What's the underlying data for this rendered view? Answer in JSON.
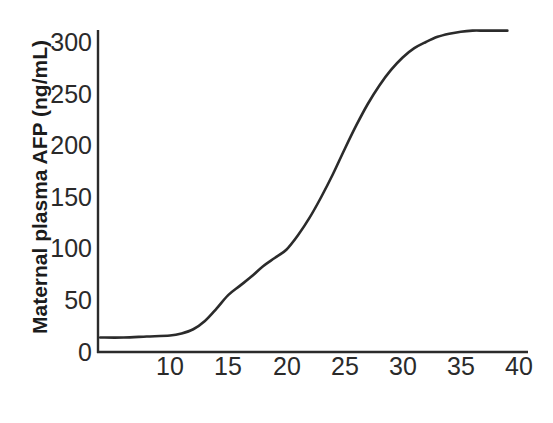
{
  "chart_data": {
    "type": "line",
    "title": "",
    "xlabel": "Gestational Age (weeks)",
    "ylabel": "Maternal plasma AFP  (ng/mL)",
    "xlim": [
      4,
      40
    ],
    "ylim": [
      0,
      310
    ],
    "xticks": [
      10,
      15,
      20,
      25,
      30,
      35,
      40
    ],
    "yticks": [
      0,
      50,
      100,
      150,
      200,
      250,
      300
    ],
    "grid": false,
    "legend": null,
    "line_color": "#2b2b2b",
    "series": [
      {
        "name": "Maternal plasma AFP",
        "x": [
          4,
          6,
          8,
          10,
          11,
          12,
          13,
          14,
          15,
          16,
          17,
          18,
          19,
          20,
          21,
          22,
          23,
          24,
          25,
          26,
          27,
          28,
          29,
          30,
          31,
          32,
          33,
          34,
          35,
          36,
          37,
          38,
          39
        ],
        "values": [
          14,
          14,
          15,
          16,
          18,
          22,
          30,
          42,
          55,
          64,
          73,
          83,
          91,
          99,
          113,
          130,
          150,
          172,
          196,
          219,
          240,
          258,
          273,
          285,
          294,
          300,
          305,
          308,
          310,
          311,
          311,
          311,
          311
        ]
      }
    ]
  },
  "axis": {
    "ytick_labels": [
      "300",
      "250",
      "200",
      "150",
      "100",
      "50",
      "0"
    ],
    "xtick_labels": [
      "10",
      "15",
      "20",
      "25",
      "30",
      "35",
      "40"
    ],
    "ylabel_text": "Maternal plasma AFP  (ng/mL)",
    "xlabel_text": "Gestational Age (weeks)"
  }
}
